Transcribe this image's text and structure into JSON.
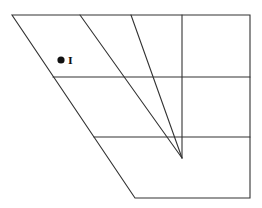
{
  "diagram": {
    "type": "geometric-figure",
    "point_label": "I",
    "colors": {
      "stroke": "#333333",
      "point": "#111111",
      "background": "#ffffff"
    },
    "outline": [
      [
        12,
        15
      ],
      [
        250,
        15
      ],
      [
        250,
        198
      ],
      [
        135,
        198
      ]
    ],
    "horizontal_lines": [
      {
        "y": 77,
        "x1": 53,
        "x2": 250
      },
      {
        "y": 137,
        "x1": 94,
        "x2": 250
      }
    ],
    "vertical_line": {
      "x": 182,
      "y1": 15,
      "y2": 158
    },
    "converging_lines": [
      {
        "from": [
          80,
          15
        ],
        "to": [
          182,
          158
        ]
      },
      {
        "from": [
          131,
          15
        ],
        "to": [
          182,
          158
        ]
      }
    ],
    "point": {
      "x": 61,
      "y": 60
    }
  }
}
